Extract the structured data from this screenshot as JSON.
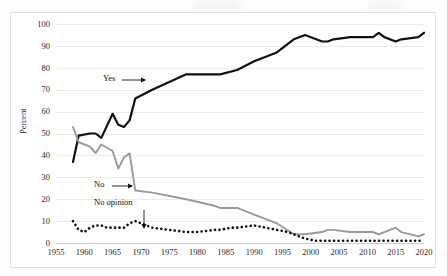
{
  "chart_data": {
    "type": "line",
    "title": "",
    "xlabel": "",
    "ylabel": "Percent",
    "xlim": [
      1955,
      2020
    ],
    "ylim": [
      0,
      100
    ],
    "ytick_labels": [
      "0",
      "10",
      "20",
      "30",
      "40",
      "50",
      "60",
      "70",
      "80",
      "90",
      "100"
    ],
    "ytick_values": [
      0,
      10,
      20,
      30,
      40,
      50,
      60,
      70,
      80,
      90,
      100
    ],
    "xtick_labels": [
      "1955",
      "1960",
      "1965",
      "1970",
      "1975",
      "1980",
      "1985",
      "1990",
      "1995",
      "2000",
      "2005",
      "2010",
      "2015",
      "2020"
    ],
    "xtick_values": [
      1955,
      1960,
      1965,
      1970,
      1975,
      1980,
      1985,
      1990,
      1995,
      2000,
      2005,
      2010,
      2015,
      2020
    ],
    "grid": true,
    "legend": "inline-annotations",
    "series": [
      {
        "name": "Yes",
        "style": "solid",
        "color": "#111111",
        "width": 2.2,
        "x": [
          1958,
          1959,
          1961,
          1962,
          1963,
          1965,
          1966,
          1967,
          1968,
          1969,
          1972,
          1978,
          1983,
          1984,
          1987,
          1990,
          1994,
          1997,
          1999,
          2002,
          2003,
          2004,
          2007,
          2011,
          2012,
          2013,
          2015,
          2016,
          2019,
          2020
        ],
        "y": [
          37,
          49,
          50,
          50,
          48,
          59,
          54,
          53,
          56,
          66,
          70,
          77,
          77,
          77,
          79,
          83,
          87,
          93,
          95,
          92,
          92,
          93,
          94,
          94,
          96,
          94,
          92,
          93,
          94,
          96
        ]
      },
      {
        "name": "No",
        "style": "solid",
        "color": "#9a9a9a",
        "width": 1.9,
        "x": [
          1958,
          1959,
          1961,
          1962,
          1963,
          1965,
          1966,
          1967,
          1968,
          1969,
          1972,
          1978,
          1983,
          1984,
          1987,
          1990,
          1994,
          1997,
          1999,
          2002,
          2003,
          2004,
          2007,
          2011,
          2012,
          2013,
          2015,
          2016,
          2019,
          2020
        ],
        "y": [
          53,
          46,
          44,
          41,
          45,
          42,
          34,
          39,
          41,
          24,
          23,
          20,
          17,
          16,
          16,
          13,
          9,
          4,
          4,
          5,
          6,
          6,
          5,
          5,
          4,
          5,
          7,
          5,
          3,
          4
        ]
      },
      {
        "name": "No opinion",
        "style": "dotted",
        "color": "#111111",
        "width": 2.6,
        "x": [
          1958,
          1959,
          1960,
          1961,
          1962,
          1963,
          1964,
          1965,
          1966,
          1967,
          1968,
          1969,
          1970,
          1972,
          1975,
          1978,
          1980,
          1983,
          1984,
          1986,
          1987,
          1990,
          1992,
          1994,
          1996,
          1997,
          1999,
          2001,
          2003,
          2005,
          2007,
          2009,
          2011,
          2013,
          2015,
          2017,
          2019,
          2020
        ],
        "y": [
          10,
          6,
          5,
          7,
          8,
          8,
          7,
          7,
          7,
          7,
          9,
          10,
          9,
          7,
          6,
          5,
          5,
          6,
          6,
          7,
          7,
          8,
          7,
          6,
          5,
          4,
          2,
          1,
          1,
          1,
          1,
          1,
          1,
          1,
          1,
          1,
          1,
          1
        ]
      }
    ],
    "annotations": [
      {
        "text": "Yes",
        "points_to": "yes-line",
        "arrow": "right"
      },
      {
        "text": "No",
        "points_to": "no-line",
        "arrow": "right"
      },
      {
        "text": "No opinion",
        "points_to": "no-opinion-line",
        "arrow": "down"
      }
    ]
  }
}
